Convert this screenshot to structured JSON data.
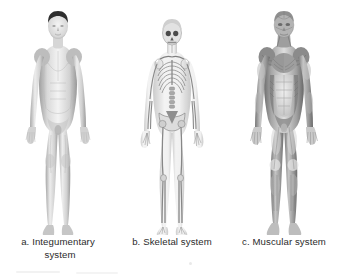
{
  "figure": {
    "background_color": "#ffffff",
    "caption_color": "#2b2b2b",
    "panel_count": 3
  },
  "panels": [
    {
      "key": "a",
      "caption_line1": "a. Integumentary",
      "caption_line2": "system",
      "system_name": "Integumentary system",
      "illustration": "human-body-skin-anterior",
      "description": "Anterior view of a male human figure showing intact skin surface",
      "tone_light": "#f2f2f2",
      "tone_mid": "#c9c9c9",
      "tone_dark": "#8d8d8d",
      "hair_color": "#2e2e2e"
    },
    {
      "key": "b",
      "caption_line1": "b. Skeletal system",
      "caption_line2": "",
      "system_name": "Skeletal system",
      "illustration": "human-body-skeleton-anterior",
      "description": "Anterior view of a human skeleton inside a translucent body outline",
      "tone_light": "#fafafa",
      "tone_mid": "#d6d6d6",
      "tone_dark": "#7c7c7c",
      "hair_color": "#cfcfcf"
    },
    {
      "key": "c",
      "caption_line1": "c. Muscular system",
      "caption_line2": "",
      "system_name": "Muscular system",
      "illustration": "human-body-musculature-anterior",
      "description": "Anterior view of human superficial musculature",
      "tone_light": "#e8e8e8",
      "tone_mid": "#9a9a9a",
      "tone_dark": "#5a5a5a",
      "hair_color": "#8a8a8a"
    }
  ]
}
